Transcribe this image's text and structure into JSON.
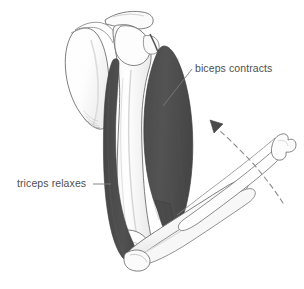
{
  "figure": {
    "type": "anatomical-diagram",
    "background_color": "#ffffff"
  },
  "labels": {
    "biceps": "biceps contracts",
    "triceps": "triceps relaxes"
  },
  "colors": {
    "muscle_fill": "#4e4e4e",
    "muscle_stroke": "#3c3c3c",
    "bone_fill": "#ffffff",
    "bone_stroke": "#6f6f6f",
    "bone_shade": "#e6e6e6",
    "bone_shade_light": "#f2f2f2",
    "text": "#4f4f4f",
    "leader_line": "#7a7a7a",
    "motion_arc": "#8c8c8c",
    "arrowhead": "#4a4a4a"
  },
  "parts": {
    "scapula": "scapula",
    "clavicle": "clavicle",
    "humerus": "humerus",
    "biceps_muscle": "biceps brachii",
    "triceps_muscle": "triceps brachii",
    "forearm_flexed": "forearm in flexed position",
    "forearm_extended": "forearm in extended position",
    "elbow_joint": "elbow joint",
    "motion_arc": "motion arc",
    "arrowhead": "direction of movement"
  }
}
